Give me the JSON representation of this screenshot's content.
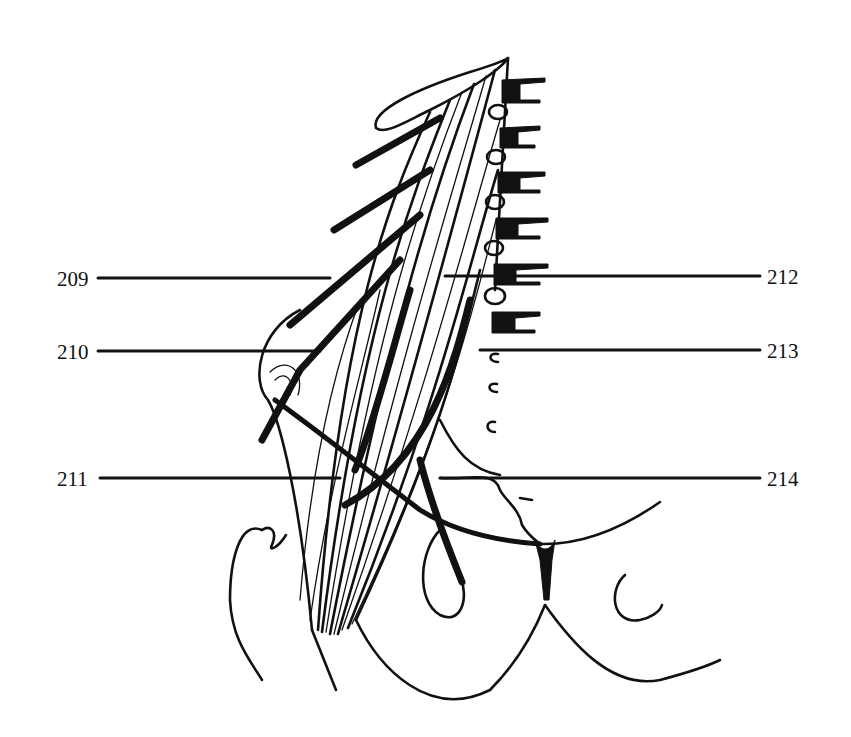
{
  "figure": {
    "type": "anatomical-line-drawing",
    "ink_color": "#111111",
    "background_color": "#ffffff"
  },
  "labels": {
    "left": [
      {
        "id": "209",
        "text": "209"
      },
      {
        "id": "210",
        "text": "210"
      },
      {
        "id": "211",
        "text": "211"
      }
    ],
    "right": [
      {
        "id": "212",
        "text": "212"
      },
      {
        "id": "213",
        "text": "213"
      },
      {
        "id": "214",
        "text": "214"
      }
    ]
  }
}
